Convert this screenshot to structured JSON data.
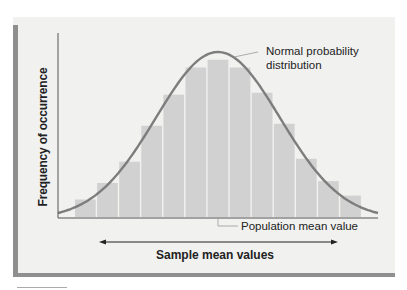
{
  "chart_data": {
    "type": "bar",
    "title": "",
    "xlabel": "Sample mean values",
    "ylabel": "Frequency of occurrence",
    "categories": [
      "1",
      "2",
      "3",
      "4",
      "5",
      "6",
      "7",
      "8",
      "9",
      "10",
      "11",
      "12",
      "13"
    ],
    "values": [
      18,
      35,
      57,
      94,
      126,
      154,
      162,
      154,
      128,
      96,
      60,
      37,
      22
    ],
    "ylim": [
      0,
      170
    ],
    "grid": false,
    "legend": "none",
    "overlay_curve": {
      "name": "Normal probability distribution",
      "type": "normal",
      "peak_at_category": "7"
    },
    "annotations": [
      {
        "text": "Normal probability distribution",
        "target": "curve peak"
      },
      {
        "text": "Population mean value",
        "target": "center of x-axis (mean)"
      }
    ],
    "x_arrow": "double-headed arrow spanning sample mean values"
  },
  "labels": {
    "ylabel": "Frequency of occurrence",
    "xlabel": "Sample mean values",
    "curve_annotation_line1": "Normal probability",
    "curve_annotation_line2": "distribution",
    "mean_annotation": "Population mean value"
  },
  "colors": {
    "bar": "#d1d1d1",
    "bar_divider": "#f4f4f4",
    "curve": "#7d7d7d",
    "axis": "#555555",
    "panel": "#f1f1f0",
    "panel_edge": "#8f8f8f"
  }
}
